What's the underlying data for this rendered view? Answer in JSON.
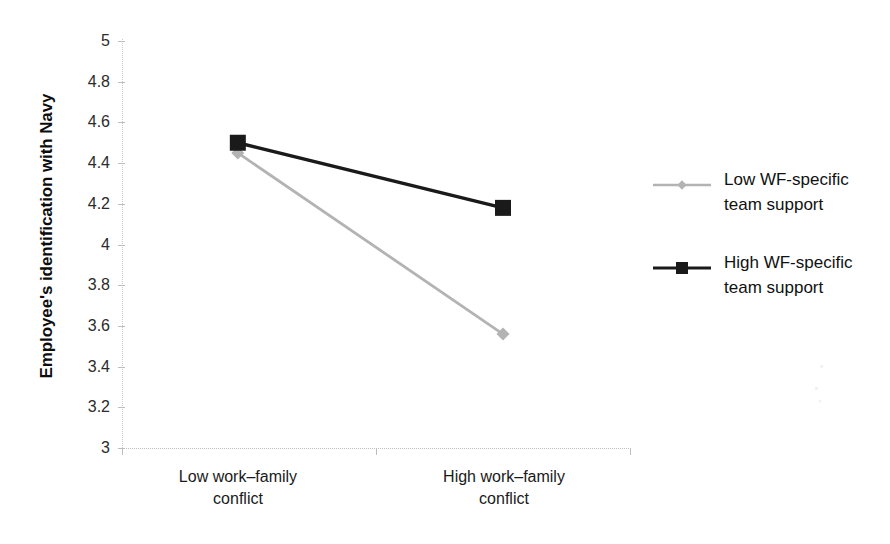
{
  "chart_data": {
    "type": "line",
    "title": "",
    "subtitle": "",
    "xlabel": "",
    "ylabel": "Employee's identification with Navy",
    "categories": [
      "Low work–family\nconflict",
      "High work–family\nconflict"
    ],
    "category_labels": [
      {
        "line1": "Low work–family",
        "line2": "conflict"
      },
      {
        "line1": "High work–family",
        "line2": "conflict"
      }
    ],
    "series": [
      {
        "name": "Low WF-specific team support",
        "legend_line1": "Low WF-specific",
        "legend_line2": "team support",
        "values": [
          4.45,
          3.56
        ],
        "color": "#b3b3b3",
        "marker": "diamond"
      },
      {
        "name": "High WF-specific team support",
        "legend_line1": "High WF-specific",
        "legend_line2": "team support",
        "values": [
          4.5,
          4.18
        ],
        "color": "#1a1a1a",
        "marker": "square"
      }
    ],
    "ylim": [
      3,
      5
    ],
    "ytick_values": [
      5,
      4.8,
      4.6,
      4.4,
      4.2,
      4,
      3.8,
      3.6,
      3.4,
      3.2,
      3
    ],
    "ytick_labels": [
      "5",
      "4.8",
      "4.6",
      "4.4",
      "4.2",
      "4",
      "3.8",
      "3.6",
      "3.4",
      "3.2",
      "3"
    ],
    "grid": false,
    "legend_position": "right"
  },
  "axis": {
    "y_title": "Employee's identification with Navy"
  },
  "legend": {
    "entries": [
      {
        "label_line1": "Low WF-specific",
        "label_line2": "team support"
      },
      {
        "label_line1": "High WF-specific",
        "label_line2": "team support"
      }
    ]
  }
}
